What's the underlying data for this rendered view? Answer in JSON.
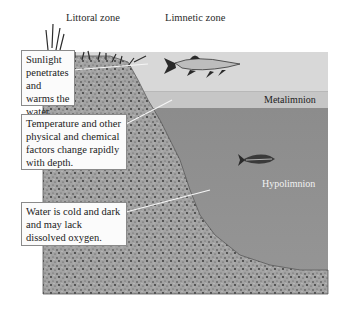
{
  "zones": {
    "littoral": "Littoral zone",
    "limnetic": "Limnetic zone"
  },
  "layers": {
    "metalimnion": "Metalimnion",
    "hypolimnion": "Hypolimnion"
  },
  "callouts": [
    {
      "id": "epilimnion-note",
      "text": "Sunlight penetrates and warms the water."
    },
    {
      "id": "metalimnion-note",
      "text": "Temperature and other physical and chemical factors change rapidly with depth."
    },
    {
      "id": "hypolimnion-note",
      "text": "Water is cold and dark and may lack dissolved oxygen."
    }
  ],
  "colors": {
    "epilimnion": "#d9d9d9",
    "metalimnion": "#c4c4c4",
    "hypolimnion": "#8e8e8e",
    "sediment": "#9a9a9a"
  }
}
